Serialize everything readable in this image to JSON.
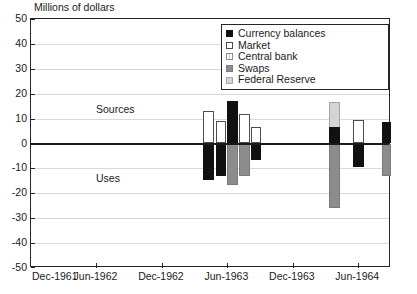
{
  "chart_data": {
    "type": "bar",
    "title": "Millions of dollars",
    "xlabel": "",
    "ylabel": "Millions of dollars",
    "ylim": [
      -50,
      50
    ],
    "yticks": [
      50,
      40,
      30,
      20,
      10,
      0,
      -10,
      -20,
      -30,
      -40,
      -50
    ],
    "grid": true,
    "legend_position": "top-right",
    "annotations": [
      {
        "text": "Sources",
        "x_units": "Dec-1962",
        "y": 13
      },
      {
        "text": "Uses",
        "x_units": "Dec-1962",
        "y": -16
      }
    ],
    "xticks": [
      "Dec-1961",
      "Jun-1962",
      "Dec-1962",
      "Jun-1963",
      "Dec-1963",
      "Jun-1964"
    ],
    "series": [
      {
        "name": "Currency balances",
        "color": "#111111",
        "style": "solid-black"
      },
      {
        "name": "Market",
        "color": "#ffffff",
        "style": "white-outline"
      },
      {
        "name": "Central bank",
        "color": "#e8e8e8",
        "style": "light-hatch"
      },
      {
        "name": "Swaps",
        "color": "#8c8c8c",
        "style": "mid-gray"
      },
      {
        "name": "Federal Reserve",
        "color": "#d4d4d4",
        "style": "pale-gray"
      }
    ],
    "bars": [
      {
        "series": "Market",
        "x": 201.5,
        "w": 11.5,
        "top": 13.0,
        "bottom": 0.0
      },
      {
        "series": "Currency balances",
        "x": 201.5,
        "w": 11.5,
        "top": 0.0,
        "bottom": -14.5
      },
      {
        "series": "Market",
        "x": 214.5,
        "w": 10.5,
        "top": 9.0,
        "bottom": 0.0
      },
      {
        "series": "Currency balances",
        "x": 214.5,
        "w": 10.5,
        "top": 0.0,
        "bottom": -13.0
      },
      {
        "series": "Currency balances",
        "x": 226.0,
        "w": 11.0,
        "top": 17.0,
        "bottom": 0.0
      },
      {
        "series": "Swaps",
        "x": 226.0,
        "w": 11.0,
        "top": 0.0,
        "bottom": -16.5
      },
      {
        "series": "Market",
        "x": 238.0,
        "w": 11.0,
        "top": 12.0,
        "bottom": 0.0
      },
      {
        "series": "Swaps",
        "x": 238.0,
        "w": 11.0,
        "top": 0.0,
        "bottom": -13.0
      },
      {
        "series": "Market",
        "x": 250.0,
        "w": 10.0,
        "top": 6.5,
        "bottom": 0.0
      },
      {
        "series": "Currency balances",
        "x": 250.0,
        "w": 10.0,
        "top": 0.0,
        "bottom": -6.5
      },
      {
        "series": "Federal Reserve",
        "x": 328.0,
        "w": 11.0,
        "top": 16.5,
        "bottom": -26.0
      },
      {
        "series": "Currency balances",
        "x": 328.0,
        "w": 11.0,
        "top": 6.5,
        "bottom": 0.0
      },
      {
        "series": "Swaps",
        "x": 328.0,
        "w": 11.0,
        "top": 0.0,
        "bottom": -26.0
      },
      {
        "series": "Market",
        "x": 352.0,
        "w": 11.0,
        "top": 9.5,
        "bottom": 0.0
      },
      {
        "series": "Currency balances",
        "x": 352.0,
        "w": 11.0,
        "top": 0.0,
        "bottom": -9.5
      },
      {
        "series": "Currency balances",
        "x": 381.0,
        "w": 11.0,
        "top": 8.5,
        "bottom": 0.0
      },
      {
        "series": "Swaps",
        "x": 381.0,
        "w": 11.0,
        "top": 0.0,
        "bottom": -13.0
      }
    ]
  },
  "legend": {
    "items": [
      {
        "label": "Currency balances"
      },
      {
        "label": "Market"
      },
      {
        "label": "Central bank"
      },
      {
        "label": "Swaps"
      },
      {
        "label": "Federal Reserve"
      }
    ]
  }
}
